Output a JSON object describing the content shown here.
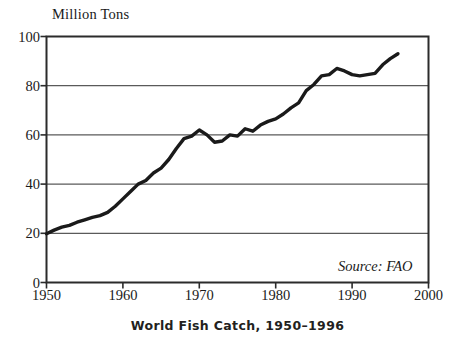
{
  "chart_data": {
    "type": "line",
    "title": "",
    "caption": "World Fish Catch, 1950–1996",
    "ylabel": "Million Tons",
    "xlabel": "",
    "source": "Source: FAO",
    "xlim": [
      1950,
      2000
    ],
    "ylim": [
      0,
      100
    ],
    "grid": true,
    "legend": "none",
    "xticks": [
      "1950",
      "1960",
      "1970",
      "1980",
      "1990",
      "2000"
    ],
    "yticks": [
      "0",
      "20",
      "40",
      "60",
      "80",
      "100"
    ],
    "series": [
      {
        "name": "World fish catch",
        "units": "million tons",
        "x": [
          1950,
          1951,
          1952,
          1953,
          1954,
          1955,
          1956,
          1957,
          1958,
          1959,
          1960,
          1961,
          1962,
          1963,
          1964,
          1965,
          1966,
          1967,
          1968,
          1969,
          1970,
          1971,
          1972,
          1973,
          1974,
          1975,
          1976,
          1977,
          1978,
          1979,
          1980,
          1981,
          1982,
          1983,
          1984,
          1985,
          1986,
          1987,
          1988,
          1989,
          1990,
          1991,
          1992,
          1993,
          1994,
          1995,
          1996
        ],
        "values": [
          19.8,
          21.3,
          22.5,
          23.2,
          24.5,
          25.5,
          26.5,
          27.2,
          28.5,
          31.0,
          34.0,
          37.0,
          40.0,
          41.5,
          44.5,
          46.5,
          50.0,
          54.5,
          58.5,
          59.5,
          62.0,
          60.0,
          57.0,
          57.5,
          60.0,
          59.5,
          62.5,
          61.5,
          64.0,
          65.5,
          66.5,
          68.5,
          71.0,
          73.0,
          78.0,
          80.5,
          84.0,
          84.5,
          87.0,
          86.0,
          84.5,
          84.0,
          84.5,
          85.0,
          88.5,
          91.0,
          93.0
        ]
      }
    ]
  },
  "figure": {
    "ylabel_text": "Million Tons",
    "caption_text": "World Fish Catch, 1950–1996",
    "source_text": "Source: FAO"
  },
  "colors": {
    "line": "#1a1a1a",
    "grid": "#5a5a5a",
    "axis": "#2b2b2b",
    "background": "#ffffff",
    "text": "#1a1a1a"
  }
}
